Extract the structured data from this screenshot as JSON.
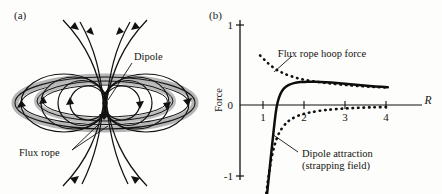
{
  "figure": {
    "panel_a_label": "(a)",
    "panel_b_label": "(b)"
  },
  "diagram": {
    "labels": {
      "dipole": "Dipole",
      "flux_rope": "Flux rope"
    },
    "colors": {
      "flux_rope_fill": "#b9b9b9",
      "field_line": "#111111",
      "background": "#fdfdfb"
    }
  },
  "chart_data": {
    "type": "line",
    "title": "",
    "xlabel": "R",
    "ylabel": "Force",
    "xlim": [
      0,
      4.35
    ],
    "ylim": [
      -1.15,
      1.15
    ],
    "xticks": [
      1,
      2,
      3,
      4
    ],
    "xtick_labels": [
      "1",
      "2",
      "3",
      "4"
    ],
    "yticks": [
      -1,
      0,
      1
    ],
    "ytick_labels": [
      "-1",
      "0",
      "1"
    ],
    "grid": false,
    "legend_position": "annotations",
    "annotations": [
      {
        "name": "flux-rope-hoop-force",
        "text": "Flux rope hoop force",
        "target_series": "Flux rope hoop force"
      },
      {
        "name": "dipole-attraction",
        "text_line1": "Dipole attraction",
        "text_line2": "(strapping field)",
        "target_series": "Dipole attraction (strapping field)"
      }
    ],
    "series": [
      {
        "name": "Flux rope hoop force",
        "style": "dotted",
        "x": [
          0.55,
          0.7,
          0.85,
          1.0,
          1.15,
          1.3,
          1.5,
          1.7,
          1.9,
          2.1,
          2.35,
          2.6,
          2.9,
          3.2,
          3.5,
          3.8,
          4.1
        ],
        "y": [
          0.62,
          0.55,
          0.49,
          0.44,
          0.405,
          0.375,
          0.345,
          0.32,
          0.305,
          0.29,
          0.275,
          0.262,
          0.25,
          0.238,
          0.23,
          0.222,
          0.215
        ]
      },
      {
        "name": "Dipole attraction (strapping field)",
        "style": "dotted",
        "x": [
          0.72,
          0.8,
          0.9,
          1.0,
          1.1,
          1.25,
          1.4,
          1.6,
          1.8,
          2.0,
          2.25,
          2.5,
          2.8,
          3.1,
          3.4,
          3.7,
          4.05
        ],
        "y": [
          -1.1,
          -0.82,
          -0.58,
          -0.42,
          -0.32,
          -0.23,
          -0.175,
          -0.13,
          -0.105,
          -0.085,
          -0.068,
          -0.056,
          -0.045,
          -0.038,
          -0.032,
          -0.028,
          -0.024
        ]
      },
      {
        "name": "Net force",
        "style": "solid",
        "x": [
          0.74,
          0.8,
          0.88,
          0.95,
          1.0,
          1.07,
          1.15,
          1.25,
          1.4,
          1.55,
          1.75,
          1.95,
          2.2,
          2.5,
          2.8,
          3.1,
          3.4,
          3.7,
          4.05
        ],
        "y": [
          -1.12,
          -0.85,
          -0.5,
          -0.2,
          -0.02,
          0.1,
          0.18,
          0.23,
          0.265,
          0.282,
          0.29,
          0.292,
          0.288,
          0.28,
          0.268,
          0.255,
          0.243,
          0.232,
          0.222
        ]
      }
    ]
  }
}
